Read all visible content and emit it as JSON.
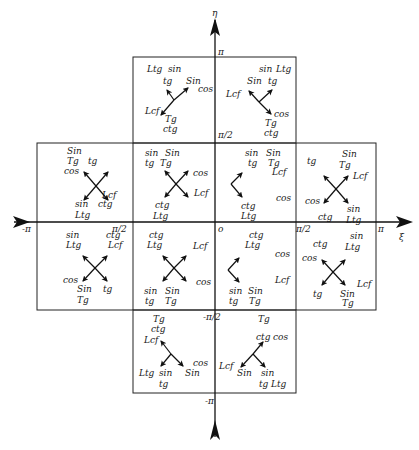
{
  "axes": {
    "horizontal": {
      "label": "ξ",
      "ticks": [
        "-π",
        "-π/2",
        "0",
        "π/2",
        "π"
      ]
    },
    "vertical": {
      "label": "η",
      "ticks": [
        "π",
        "π/2",
        "0",
        "-π/2",
        "-π"
      ]
    }
  },
  "tick_labels": {
    "h_neg_pi": "-π",
    "h_pi": "π",
    "h_half": "π/2",
    "v_pi": "π",
    "v_half": "π/2",
    "v_neg_half": "-π/2",
    "v_neg_pi": "-π",
    "origin": "o",
    "xi": "ξ",
    "eta": "η",
    "neg_half_ctg": "ctg - π/2"
  },
  "cells": [
    {
      "id": "top-left",
      "labels": [
        "Ltg",
        "sin",
        "tg",
        "Sin",
        "cos",
        "Lcf",
        "Tg",
        "ctg"
      ]
    },
    {
      "id": "top-right",
      "labels": [
        "sin",
        "Ltg",
        "Sin",
        "tg",
        "Lcf",
        "cos",
        "Tg",
        "ctg"
      ]
    },
    {
      "id": "upper-far-left",
      "labels": [
        "Sin",
        "Tg",
        "tg",
        "cos",
        "Lcf",
        "sin",
        "ctg",
        "Ltg"
      ]
    },
    {
      "id": "upper-mid-left",
      "labels": [
        "sin",
        "Sin",
        "tg",
        "Tg",
        "cos",
        "Lcf",
        "ctg",
        "Ltg"
      ]
    },
    {
      "id": "upper-mid-right",
      "labels": [
        "sin",
        "Sin",
        "tg",
        "Tg",
        "Lcf",
        "cos",
        "ctg",
        "Ltg"
      ]
    },
    {
      "id": "upper-far-right",
      "labels": [
        "tg",
        "Sin",
        "Tg",
        "Lcf",
        "cos",
        "ctg",
        "sin",
        "Ltg"
      ]
    },
    {
      "id": "lower-far-left",
      "labels": [
        "sin",
        "Ltg",
        "ctg",
        "Lcf",
        "cos",
        "Sin",
        "tg",
        "Tg"
      ]
    },
    {
      "id": "lower-mid-left",
      "labels": [
        "ctg",
        "Ltg",
        "Lcf",
        "cos",
        "sin",
        "Sin",
        "tg",
        "Tg"
      ]
    },
    {
      "id": "lower-mid-right",
      "labels": [
        "ctg",
        "Ltg",
        "cos",
        "Lcf",
        "sin",
        "Sin",
        "tg",
        "Tg"
      ]
    },
    {
      "id": "lower-far-right",
      "labels": [
        "ctg",
        "sin",
        "Ltg",
        "cos",
        "Lcf",
        "tg",
        "Sin",
        "Tg"
      ]
    },
    {
      "id": "bottom-left",
      "labels": [
        "Tg",
        "ctg",
        "Lcf",
        "cos",
        "Ltg",
        "sin",
        "Sin",
        "tg"
      ]
    },
    {
      "id": "bottom-right",
      "labels": [
        "Tg",
        "ctg",
        "cos",
        "Lcf",
        "Sin",
        "sin",
        "tg",
        "Ltg"
      ]
    }
  ]
}
